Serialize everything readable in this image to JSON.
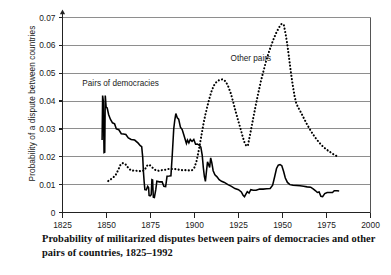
{
  "figure": {
    "caption_line1": "Probability of militarized disputes between pairs of democracies and",
    "caption_line2": "other pairs of countries, 1825–1992",
    "y_axis_title": "Probability of a dispute between countries"
  },
  "chart_data": {
    "type": "line",
    "title": "",
    "xlabel": "",
    "ylabel": "Probability of a dispute between countries",
    "xlim": [
      1825,
      2000
    ],
    "ylim": [
      0,
      0.07
    ],
    "xticks": [
      1825,
      1850,
      1875,
      1900,
      1925,
      1950,
      1975,
      2000
    ],
    "xtick_labels": [
      "1825",
      "1850",
      "1875",
      "1900",
      "1925",
      "1950",
      "1975",
      "2000"
    ],
    "yticks": [
      0,
      0.01,
      0.02,
      0.03,
      0.04,
      0.05,
      0.06,
      0.07
    ],
    "ytick_labels": [
      "0",
      "0.01",
      "0.02",
      "0.03",
      "0.04",
      "0.05",
      "0.06",
      "0.07"
    ],
    "grid": "horizontal",
    "legend_position": "inline-annotations",
    "annotations": [
      {
        "text": "Pairs of democracies",
        "x": 1858,
        "y": 0.0455,
        "series": "pairs_of_democracies"
      },
      {
        "text": "Other pairs",
        "x": 1932,
        "y": 0.0545,
        "series": "other_pairs"
      }
    ],
    "series": [
      {
        "name": "Pairs of democracies",
        "style": "solid",
        "color": "#000000",
        "points": [
          [
            1847.5,
            0.026
          ],
          [
            1847.8,
            0.042
          ],
          [
            1848.2,
            0.04
          ],
          [
            1848.6,
            0.0215
          ],
          [
            1849.0,
            0.0216
          ],
          [
            1849.3,
            0.042
          ],
          [
            1849.8,
            0.0378
          ],
          [
            1850.4,
            0.0375
          ],
          [
            1851.2,
            0.0352
          ],
          [
            1852.2,
            0.0335
          ],
          [
            1853.4,
            0.0322
          ],
          [
            1854.6,
            0.0318
          ],
          [
            1855.6,
            0.03
          ],
          [
            1857.0,
            0.0297
          ],
          [
            1858.4,
            0.0283
          ],
          [
            1859.6,
            0.0282
          ],
          [
            1861.0,
            0.028
          ],
          [
            1862.4,
            0.0268
          ],
          [
            1864.0,
            0.0262
          ],
          [
            1866.0,
            0.026
          ],
          [
            1868.0,
            0.0249
          ],
          [
            1869.2,
            0.024
          ],
          [
            1870.0,
            0.0236
          ],
          [
            1870.6,
            0.0196
          ],
          [
            1871.0,
            0.0145
          ],
          [
            1871.4,
            0.011
          ],
          [
            1871.8,
            0.0082
          ],
          [
            1872.6,
            0.0081
          ],
          [
            1873.4,
            0.0094
          ],
          [
            1873.9,
            0.009
          ],
          [
            1874.2,
            0.0061
          ],
          [
            1874.8,
            0.006
          ],
          [
            1875.4,
            0.0064
          ],
          [
            1875.8,
            0.0118
          ],
          [
            1876.2,
            0.0117
          ],
          [
            1876.6,
            0.0055
          ],
          [
            1877.2,
            0.0054
          ],
          [
            1878.0,
            0.0082
          ],
          [
            1878.6,
            0.0112
          ],
          [
            1880.0,
            0.011
          ],
          [
            1881.6,
            0.011
          ],
          [
            1882.6,
            0.0094
          ],
          [
            1883.6,
            0.0093
          ],
          [
            1884.4,
            0.013
          ],
          [
            1885.6,
            0.0131
          ],
          [
            1886.6,
            0.0132
          ],
          [
            1887.4,
            0.021
          ],
          [
            1888.2,
            0.03
          ],
          [
            1888.8,
            0.0332
          ],
          [
            1889.4,
            0.0355
          ],
          [
            1890.2,
            0.034
          ],
          [
            1891.0,
            0.0335
          ],
          [
            1892.0,
            0.0306
          ],
          [
            1893.0,
            0.0298
          ],
          [
            1894.0,
            0.0277
          ],
          [
            1894.8,
            0.026
          ],
          [
            1895.4,
            0.0248
          ],
          [
            1896.0,
            0.026
          ],
          [
            1896.8,
            0.025
          ],
          [
            1897.6,
            0.0262
          ],
          [
            1898.6,
            0.0255
          ],
          [
            1899.6,
            0.0262
          ],
          [
            1900.6,
            0.0245
          ],
          [
            1901.6,
            0.0246
          ],
          [
            1902.6,
            0.0242
          ],
          [
            1903.6,
            0.0235
          ],
          [
            1904.4,
            0.0205
          ],
          [
            1905.0,
            0.0162
          ],
          [
            1905.6,
            0.013
          ],
          [
            1906.2,
            0.0112
          ],
          [
            1906.8,
            0.0148
          ],
          [
            1907.4,
            0.0182
          ],
          [
            1908.0,
            0.0172
          ],
          [
            1908.6,
            0.0162
          ],
          [
            1909.2,
            0.0196
          ],
          [
            1909.8,
            0.018
          ],
          [
            1910.6,
            0.015
          ],
          [
            1911.6,
            0.0135
          ],
          [
            1912.8,
            0.0128
          ],
          [
            1914.0,
            0.0118
          ],
          [
            1915.4,
            0.0112
          ],
          [
            1917.0,
            0.0108
          ],
          [
            1919.0,
            0.01
          ],
          [
            1921.0,
            0.0094
          ],
          [
            1923.0,
            0.0086
          ],
          [
            1925.0,
            0.0082
          ],
          [
            1926.6,
            0.0074
          ],
          [
            1927.6,
            0.0062
          ],
          [
            1928.4,
            0.0057
          ],
          [
            1929.2,
            0.0066
          ],
          [
            1930.0,
            0.0075
          ],
          [
            1931.0,
            0.007
          ],
          [
            1932.0,
            0.0082
          ],
          [
            1933.4,
            0.008
          ],
          [
            1935.0,
            0.008
          ],
          [
            1937.0,
            0.0084
          ],
          [
            1939.0,
            0.0084
          ],
          [
            1941.0,
            0.0085
          ],
          [
            1943.0,
            0.0086
          ],
          [
            1944.4,
            0.0098
          ],
          [
            1945.6,
            0.013
          ],
          [
            1946.6,
            0.0158
          ],
          [
            1947.6,
            0.017
          ],
          [
            1948.6,
            0.0172
          ],
          [
            1949.6,
            0.0168
          ],
          [
            1950.6,
            0.0148
          ],
          [
            1951.6,
            0.0124
          ],
          [
            1952.8,
            0.0108
          ],
          [
            1954.2,
            0.01
          ],
          [
            1956.0,
            0.0098
          ],
          [
            1958.0,
            0.0097
          ],
          [
            1960.0,
            0.0096
          ],
          [
            1962.0,
            0.0094
          ],
          [
            1964.0,
            0.0092
          ],
          [
            1966.0,
            0.0091
          ],
          [
            1967.6,
            0.0084
          ],
          [
            1968.8,
            0.0078
          ],
          [
            1969.8,
            0.0072
          ],
          [
            1970.8,
            0.0074
          ],
          [
            1971.8,
            0.0058
          ],
          [
            1972.8,
            0.0057
          ],
          [
            1974.0,
            0.0068
          ],
          [
            1975.4,
            0.0072
          ],
          [
            1977.0,
            0.0072
          ],
          [
            1978.4,
            0.0072
          ],
          [
            1979.4,
            0.0078
          ],
          [
            1981.0,
            0.0078
          ],
          [
            1982.2,
            0.0077
          ]
        ]
      },
      {
        "name": "Other pairs",
        "style": "dotted",
        "color": "#000000",
        "points": [
          [
            1851.0,
            0.0113
          ],
          [
            1853.0,
            0.0122
          ],
          [
            1855.0,
            0.0132
          ],
          [
            1856.6,
            0.0152
          ],
          [
            1858.0,
            0.0172
          ],
          [
            1859.4,
            0.0178
          ],
          [
            1861.0,
            0.0172
          ],
          [
            1862.6,
            0.0158
          ],
          [
            1864.2,
            0.015
          ],
          [
            1866.0,
            0.0151
          ],
          [
            1868.0,
            0.0149
          ],
          [
            1870.0,
            0.0148
          ],
          [
            1871.6,
            0.0152
          ],
          [
            1873.0,
            0.0168
          ],
          [
            1874.2,
            0.0172
          ],
          [
            1875.4,
            0.0166
          ],
          [
            1876.6,
            0.0158
          ],
          [
            1878.0,
            0.0152
          ],
          [
            1879.6,
            0.015
          ],
          [
            1881.4,
            0.0152
          ],
          [
            1883.2,
            0.0153
          ],
          [
            1885.0,
            0.0156
          ],
          [
            1887.0,
            0.0156
          ],
          [
            1889.0,
            0.0156
          ],
          [
            1891.0,
            0.0154
          ],
          [
            1893.0,
            0.0152
          ],
          [
            1895.0,
            0.0152
          ],
          [
            1897.0,
            0.0151
          ],
          [
            1898.6,
            0.0152
          ],
          [
            1900.0,
            0.0162
          ],
          [
            1901.2,
            0.0186
          ],
          [
            1902.2,
            0.0216
          ],
          [
            1903.2,
            0.025
          ],
          [
            1904.2,
            0.0286
          ],
          [
            1905.2,
            0.0322
          ],
          [
            1906.2,
            0.0352
          ],
          [
            1907.2,
            0.0378
          ],
          [
            1908.4,
            0.0408
          ],
          [
            1909.6,
            0.0434
          ],
          [
            1911.0,
            0.0456
          ],
          [
            1912.6,
            0.047
          ],
          [
            1914.4,
            0.0477
          ],
          [
            1916.2,
            0.0478
          ],
          [
            1917.8,
            0.047
          ],
          [
            1919.2,
            0.0452
          ],
          [
            1920.6,
            0.0428
          ],
          [
            1922.0,
            0.0396
          ],
          [
            1923.4,
            0.0362
          ],
          [
            1924.8,
            0.033
          ],
          [
            1926.2,
            0.03
          ],
          [
            1927.4,
            0.0272
          ],
          [
            1928.6,
            0.0248
          ],
          [
            1929.6,
            0.0238
          ],
          [
            1930.4,
            0.0242
          ],
          [
            1931.2,
            0.0268
          ],
          [
            1932.2,
            0.03
          ],
          [
            1933.4,
            0.034
          ],
          [
            1934.8,
            0.0385
          ],
          [
            1936.2,
            0.0428
          ],
          [
            1937.6,
            0.0468
          ],
          [
            1939.2,
            0.0508
          ],
          [
            1940.8,
            0.0546
          ],
          [
            1942.6,
            0.0582
          ],
          [
            1944.4,
            0.0614
          ],
          [
            1946.2,
            0.0642
          ],
          [
            1948.0,
            0.0664
          ],
          [
            1949.6,
            0.0678
          ],
          [
            1950.8,
            0.0672
          ],
          [
            1951.8,
            0.064
          ],
          [
            1952.8,
            0.06
          ],
          [
            1953.8,
            0.0552
          ],
          [
            1954.8,
            0.0502
          ],
          [
            1955.8,
            0.0458
          ],
          [
            1956.8,
            0.042
          ],
          [
            1957.8,
            0.0392
          ],
          [
            1959.0,
            0.0376
          ],
          [
            1960.4,
            0.036
          ],
          [
            1962.0,
            0.034
          ],
          [
            1963.8,
            0.0318
          ],
          [
            1965.6,
            0.0298
          ],
          [
            1967.4,
            0.028
          ],
          [
            1969.2,
            0.0264
          ],
          [
            1971.0,
            0.025
          ],
          [
            1972.8,
            0.0238
          ],
          [
            1974.6,
            0.0228
          ],
          [
            1976.4,
            0.022
          ],
          [
            1978.2,
            0.0212
          ],
          [
            1980.0,
            0.0205
          ],
          [
            1981.8,
            0.02
          ]
        ]
      }
    ]
  }
}
